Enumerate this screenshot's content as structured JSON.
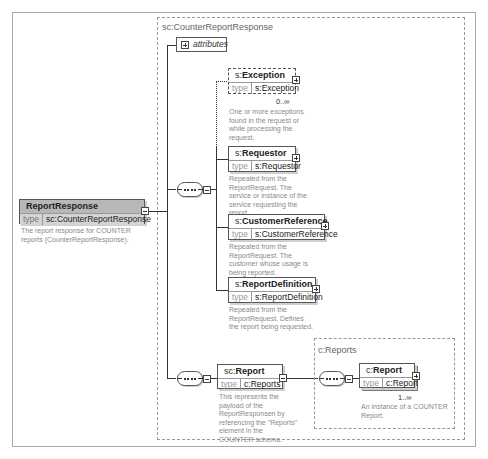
{
  "diagram": {
    "root": {
      "name": "ReportResponse",
      "type_label": "type",
      "type": "sc:CounterReportResponse",
      "description": "The report response for COUNTER reports (CounterReportResponse)."
    },
    "complex_type": {
      "title": "sc:CounterReportResponse",
      "attributes_label": "attributes",
      "children": [
        {
          "prefix": "s:",
          "name": "Exception",
          "type_label": "type",
          "type": "s:Exception",
          "cardinality": "0..∞",
          "optional": true,
          "description": "One or more exceptions found in the request or while processing the request."
        },
        {
          "prefix": "s:",
          "name": "Requestor",
          "type_label": "type",
          "type": "s:Requestor",
          "description": "Repeated from the ReportRequest. The service or instance of the service requesting the report."
        },
        {
          "prefix": "s:",
          "name": "CustomerReference",
          "type_label": "type",
          "type": "s:CustomerReference",
          "description": "Repeated from the ReportRequest. The customer whose usage is being reported."
        },
        {
          "prefix": "s:",
          "name": "ReportDefinition",
          "type_label": "type",
          "type": "s:ReportDefinition",
          "description": "Repeated from the ReportRequest. Defines the report being requested."
        },
        {
          "prefix": "sc:",
          "name": "Report",
          "type_label": "type",
          "type": "c:Reports",
          "description": "This represents the payload of the ReportResponsen by referencing the \"Reports\" element in the COUNTER schema."
        }
      ]
    },
    "reports_type": {
      "title": "c:Reports",
      "child": {
        "prefix": "c:",
        "name": "Report",
        "type_label": "type",
        "type": "c:Report",
        "cardinality": "1..∞",
        "description": "An instance of a COUNTER Report."
      }
    }
  }
}
